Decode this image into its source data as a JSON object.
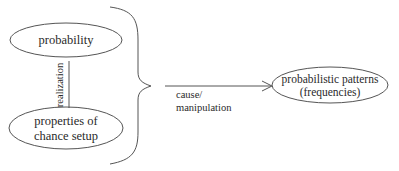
{
  "nodes": {
    "probability": {
      "label": "probability"
    },
    "chance_setup": {
      "line1": "properties of",
      "line2": "chance setup"
    },
    "patterns": {
      "line1": "probabilistic patterns",
      "line2": "(frequencies)"
    }
  },
  "edges": {
    "realization": {
      "label": "realization"
    },
    "cause": {
      "line1": "cause/",
      "line2": "manipulation"
    }
  },
  "colors": {
    "stroke": "#555555",
    "text": "#2a2a2a",
    "background": "#ffffff"
  }
}
